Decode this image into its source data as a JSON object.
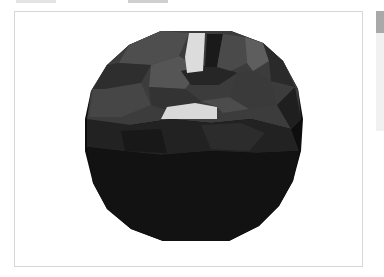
{
  "tabs": [
    {
      "label": "",
      "active": false
    },
    {
      "label": "",
      "active": true
    }
  ],
  "viewport": {
    "label": "",
    "object": "faceted-sphere-mesh",
    "background": "#ffffff",
    "mesh_colors": {
      "darkest": "#0b0b0b",
      "dark": "#1c1c1c",
      "mid": "#3a3a3a",
      "light": "#5a5a5a",
      "highlight": "#dcdcdc"
    }
  },
  "scrollbar": {
    "thumb_color": "#a9a9a9",
    "track_color": "#f1f1f1"
  }
}
